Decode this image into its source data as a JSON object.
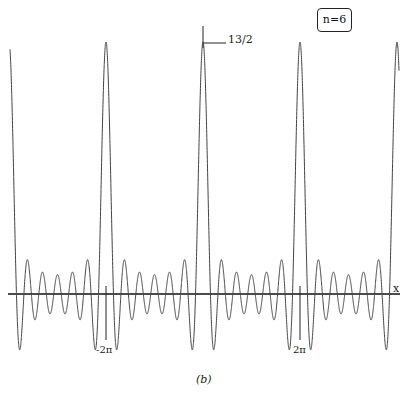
{
  "chart_data": {
    "type": "line",
    "title": "",
    "function": "sin((n+1/2)x) / (2 sin(x/2))",
    "n": 6,
    "badge": "n=6",
    "peak_value": 6.5,
    "peak_label": "13/2",
    "xlabel": "x",
    "ylabel": "",
    "x_ticks": [
      {
        "value": -6.2832,
        "label": "-2π"
      },
      {
        "value": 6.2832,
        "label": "2π"
      }
    ],
    "xlim": [
      -12.3,
      12.6
    ],
    "ylim": [
      -1.6,
      6.6
    ],
    "grid": false,
    "legend": "none",
    "peaks_at": [
      "-4π",
      "-2π",
      "0",
      "2π",
      "4π"
    ],
    "caption": "(b)"
  },
  "labels": {
    "badge": "n=6",
    "peak": "13/2",
    "x_axis": "x",
    "tick_neg": "-2π",
    "tick_pos": "2π",
    "caption": "(b)"
  }
}
